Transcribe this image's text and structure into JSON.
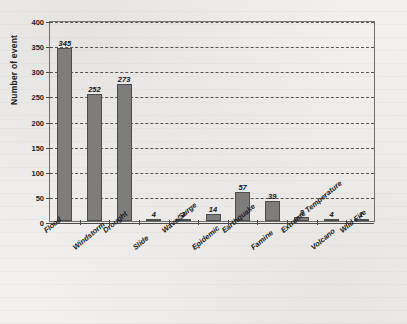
{
  "chart_data": {
    "type": "bar",
    "title": "",
    "subtitle": "",
    "xlabel": "",
    "ylabel": "Number of event",
    "ylim": [
      0,
      400
    ],
    "ytick_step": 50,
    "yticks": [
      "0",
      "50",
      "100",
      "150",
      "200",
      "250",
      "300",
      "350",
      "400"
    ],
    "grid": "horizontal-dashed",
    "legend": "none",
    "categories": [
      "Flood",
      "Windstorm",
      "Drought",
      "Slide",
      "Wave/Surge",
      "Epidemic",
      "Earthquake",
      "Famine",
      "Extreme Temperature",
      "Volcano",
      "Wild Fire"
    ],
    "values": [
      345,
      252,
      273,
      4,
      3,
      14,
      57,
      39,
      8,
      4,
      1
    ],
    "value_labels": [
      "345",
      "252",
      "273",
      "4",
      "3",
      "14",
      "57",
      "39",
      "8",
      "4",
      "1"
    ],
    "bar_color": "#7d7d7d",
    "bar_border_color": "#4d4d4d",
    "axis_color": "#4a4a4a",
    "gridline_color": "#3c3c3c",
    "background_color": "#f2f1ef"
  }
}
